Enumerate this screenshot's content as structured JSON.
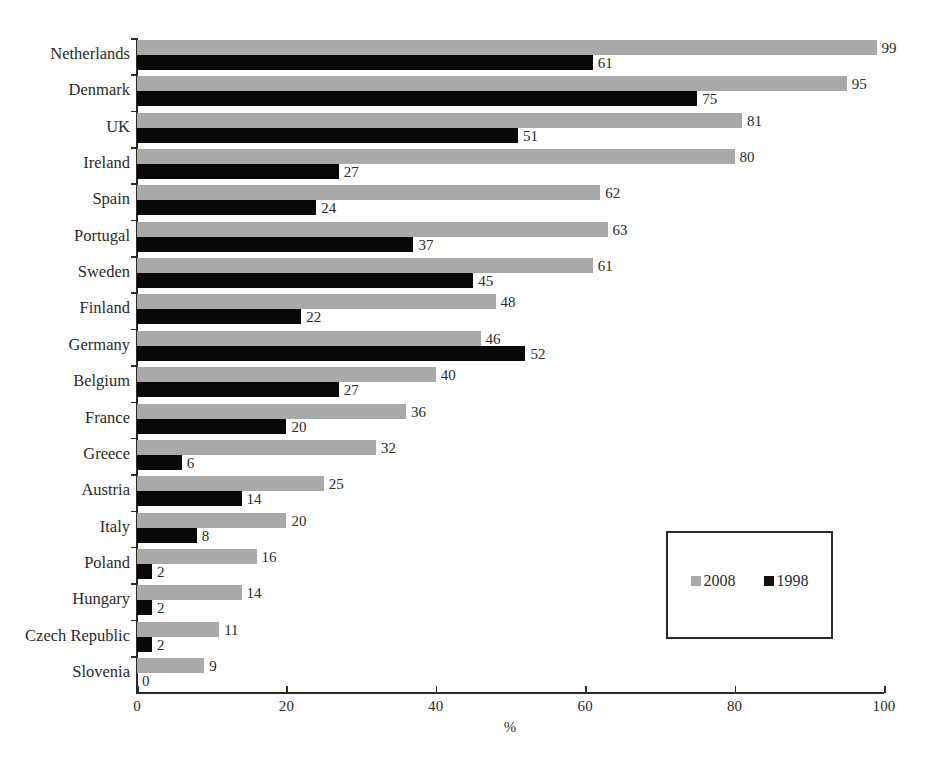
{
  "chart_data": {
    "type": "bar",
    "orientation": "horizontal",
    "title": "",
    "xlabel": "%",
    "ylabel": "",
    "xlim": [
      0,
      100
    ],
    "xticks": [
      0,
      20,
      40,
      60,
      80,
      100
    ],
    "grid": false,
    "legend_position": "inside-lower-right",
    "categories": [
      "Netherlands",
      "Denmark",
      "UK",
      "Ireland",
      "Spain",
      "Portugal",
      "Sweden",
      "Finland",
      "Germany",
      "Belgium",
      "France",
      "Greece",
      "Austria",
      "Italy",
      "Poland",
      "Hungary",
      "Czech Republic",
      "Slovenia"
    ],
    "series": [
      {
        "name": "2008",
        "color": "#a9a9a9",
        "values": [
          99,
          95,
          81,
          80,
          62,
          63,
          61,
          48,
          46,
          40,
          36,
          32,
          25,
          20,
          16,
          14,
          11,
          9
        ]
      },
      {
        "name": "1998",
        "color": "#080808",
        "values": [
          61,
          75,
          51,
          27,
          24,
          37,
          45,
          22,
          52,
          27,
          20,
          6,
          14,
          8,
          2,
          2,
          2,
          0
        ]
      }
    ]
  },
  "legend": {
    "entries": [
      {
        "label": "2008",
        "color": "#a9a9a9"
      },
      {
        "label": "1998",
        "color": "#121212"
      }
    ]
  },
  "axis": {
    "x_title": "%",
    "x_tick_labels": [
      "0",
      "20",
      "40",
      "60",
      "80",
      "100"
    ]
  }
}
